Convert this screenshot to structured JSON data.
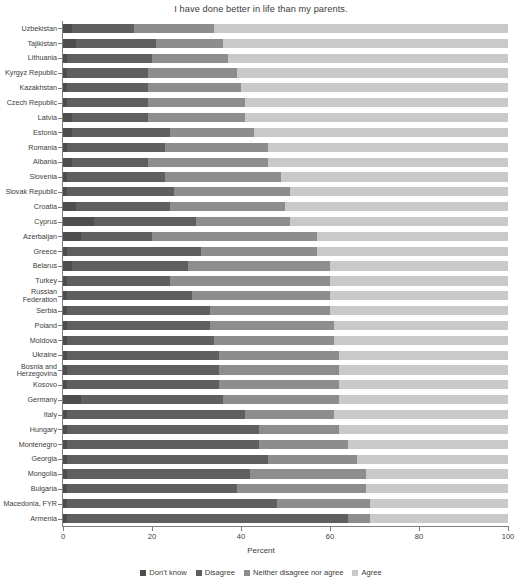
{
  "chart_data": {
    "type": "bar",
    "orientation": "horizontal",
    "stacked": true,
    "title": "I have done better in life than my parents.",
    "xlabel": "Percent",
    "ylabel": "",
    "xlim": [
      0,
      100
    ],
    "xticks": [
      0,
      20,
      40,
      60,
      80,
      100
    ],
    "grid": false,
    "legend_position": "bottom",
    "legend": [
      "Don't know",
      "Disagree",
      "Neither disagree nor agree",
      "Agree"
    ],
    "colors": [
      "#4d4d4d",
      "#5f5f5f",
      "#8d8d8d",
      "#c9c9c9"
    ],
    "categories": [
      "Uzbekistan",
      "Tajikistan",
      "Lithuania",
      "Kyrgyz Republic",
      "Kazakhstan",
      "Czech Republic",
      "Latvia",
      "Estonia",
      "Romania",
      "Albania",
      "Slovenia",
      "Slovak Republic",
      "Croatia",
      "Cyprus",
      "Azerbaijan",
      "Greece",
      "Belarus",
      "Turkey",
      "Russian\nFederation",
      "Serbia",
      "Poland",
      "Moldova",
      "Ukraine",
      "Bosnia and\nHerzegovina",
      "Kosovo",
      "Germany",
      "Italy",
      "Hungary",
      "Montenegro",
      "Georgia",
      "Mongolia",
      "Bulgaria",
      "Macedonia, FYR",
      "Armenia"
    ],
    "series": [
      {
        "name": "Don't know",
        "values": [
          2.0,
          3.0,
          1.0,
          1.0,
          1.0,
          1.0,
          2.0,
          2.0,
          1.0,
          2.0,
          1.0,
          1.0,
          3.0,
          7.0,
          4.0,
          1.0,
          2.0,
          1.0,
          1.0,
          1.0,
          1.0,
          1.0,
          1.0,
          1.0,
          1.0,
          4.0,
          1.0,
          1.0,
          1.0,
          1.0,
          1.0,
          1.0,
          1.0,
          1.0
        ]
      },
      {
        "name": "Disagree",
        "values": [
          14.0,
          18.0,
          19.0,
          18.0,
          18.0,
          18.0,
          17.0,
          22.0,
          22.0,
          17.0,
          22.0,
          24.0,
          21.0,
          23.0,
          16.0,
          30.0,
          26.0,
          23.0,
          28.0,
          32.0,
          32.0,
          33.0,
          34.0,
          34.0,
          34.0,
          32.0,
          40.0,
          43.0,
          43.0,
          45.0,
          41.0,
          38.0,
          47.0,
          63.0
        ]
      },
      {
        "name": "Neither disagree nor agree",
        "values": [
          18.0,
          15.0,
          17.0,
          20.0,
          21.0,
          22.0,
          22.0,
          19.0,
          23.0,
          27.0,
          26.0,
          26.0,
          26.0,
          21.0,
          37.0,
          26.0,
          32.0,
          36.0,
          31.0,
          27.0,
          28.0,
          27.0,
          27.0,
          27.0,
          27.0,
          26.0,
          20.0,
          18.0,
          20.0,
          20.0,
          26.0,
          29.0,
          21.0,
          5.0
        ]
      },
      {
        "name": "Agree",
        "values": [
          66.0,
          64.0,
          63.0,
          61.0,
          60.0,
          59.0,
          59.0,
          57.0,
          54.0,
          54.0,
          51.0,
          49.0,
          50.0,
          49.0,
          43.0,
          43.0,
          40.0,
          40.0,
          40.0,
          40.0,
          39.0,
          39.0,
          38.0,
          38.0,
          38.0,
          38.0,
          39.0,
          38.0,
          36.0,
          34.0,
          32.0,
          32.0,
          31.0,
          31.0
        ]
      }
    ]
  }
}
